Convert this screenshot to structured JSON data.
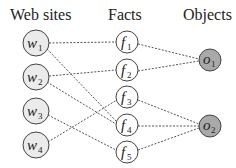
{
  "headers": {
    "websites": "Web sites",
    "facts": "Facts",
    "objects": "Objects"
  },
  "colors": {
    "website_fill": "#ebebeb",
    "fact_fill": "#ffffff",
    "object_fill": "#a9a9a9",
    "stroke": "#444444"
  },
  "websites": [
    {
      "id": "w1",
      "base": "w",
      "sub": "1"
    },
    {
      "id": "w2",
      "base": "w",
      "sub": "2"
    },
    {
      "id": "w3",
      "base": "w",
      "sub": "3"
    },
    {
      "id": "w4",
      "base": "w",
      "sub": "4"
    }
  ],
  "facts": [
    {
      "id": "f1",
      "base": "f",
      "sub": "1"
    },
    {
      "id": "f2",
      "base": "f",
      "sub": "2"
    },
    {
      "id": "f3",
      "base": "f",
      "sub": "3"
    },
    {
      "id": "f4",
      "base": "f",
      "sub": "4"
    },
    {
      "id": "f5",
      "base": "f",
      "sub": "5"
    }
  ],
  "objects": [
    {
      "id": "o1",
      "base": "o",
      "sub": "1"
    },
    {
      "id": "o2",
      "base": "o",
      "sub": "2"
    }
  ],
  "edges": [
    [
      "w1",
      "f1"
    ],
    [
      "w1",
      "f4"
    ],
    [
      "w2",
      "f2"
    ],
    [
      "w2",
      "f4"
    ],
    [
      "w3",
      "f5"
    ],
    [
      "w4",
      "f3"
    ],
    [
      "f1",
      "o1"
    ],
    [
      "f2",
      "o1"
    ],
    [
      "f3",
      "o2"
    ],
    [
      "f4",
      "o2"
    ],
    [
      "f5",
      "o2"
    ]
  ]
}
